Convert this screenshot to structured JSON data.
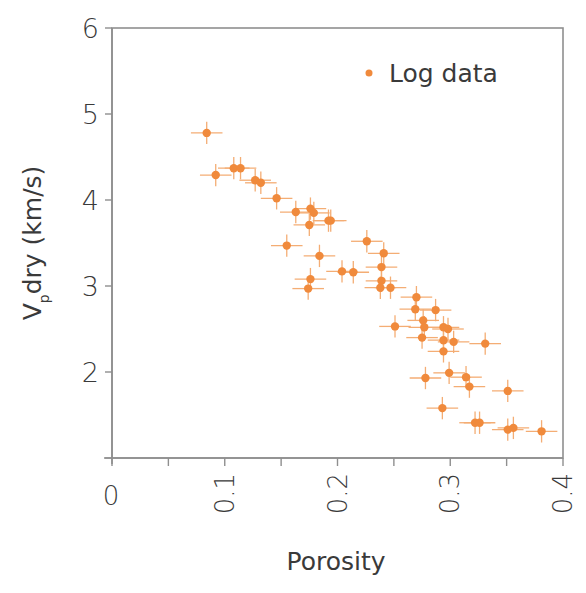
{
  "chart_data": {
    "type": "scatter",
    "title": "",
    "xlabel": "Porosity",
    "ylabel_main": "V",
    "ylabel_sub": "p",
    "ylabel_rest": "dry (km/s)",
    "ylabel": "Vp dry (km/s)",
    "xlim": [
      0,
      0.4
    ],
    "ylim": [
      1,
      6
    ],
    "x_ticks": [
      0,
      0.05,
      0.1,
      0.15,
      0.2,
      0.25,
      0.3,
      0.35,
      0.4
    ],
    "x_tick_labels": [
      {
        "value": 0,
        "label": "0"
      },
      {
        "value": 0.1,
        "label": "0.1"
      },
      {
        "value": 0.2,
        "label": "0.2"
      },
      {
        "value": 0.3,
        "label": "0.3"
      },
      {
        "value": 0.4,
        "label": "0.4"
      }
    ],
    "y_ticks": [
      1,
      2,
      3,
      4,
      5,
      6
    ],
    "y_tick_labels": [
      {
        "value": 2,
        "label": "2"
      },
      {
        "value": 3,
        "label": "3"
      },
      {
        "value": 4,
        "label": "4"
      },
      {
        "value": 5,
        "label": "5"
      },
      {
        "value": 6,
        "label": "6"
      }
    ],
    "grid": false,
    "legend": {
      "position": "upper right",
      "entries": [
        "Log data"
      ]
    },
    "colors": {
      "point": "#f08a3c",
      "errorbar": "#f4ad74",
      "axis": "#8f8f8f",
      "text": "#3a3a3a"
    },
    "error": {
      "x": 0.014,
      "y": 0.13
    },
    "series": [
      {
        "name": "Log data",
        "points": [
          [
            0.084,
            4.78
          ],
          [
            0.092,
            4.29
          ],
          [
            0.108,
            4.37
          ],
          [
            0.114,
            4.37
          ],
          [
            0.127,
            4.23
          ],
          [
            0.132,
            4.2
          ],
          [
            0.146,
            4.02
          ],
          [
            0.163,
            3.86
          ],
          [
            0.176,
            3.9
          ],
          [
            0.179,
            3.85
          ],
          [
            0.175,
            3.71
          ],
          [
            0.192,
            3.76
          ],
          [
            0.194,
            3.76
          ],
          [
            0.155,
            3.47
          ],
          [
            0.184,
            3.35
          ],
          [
            0.226,
            3.52
          ],
          [
            0.241,
            3.38
          ],
          [
            0.239,
            3.22
          ],
          [
            0.239,
            3.06
          ],
          [
            0.238,
            2.98
          ],
          [
            0.247,
            2.98
          ],
          [
            0.204,
            3.17
          ],
          [
            0.214,
            3.16
          ],
          [
            0.176,
            3.08
          ],
          [
            0.174,
            2.97
          ],
          [
            0.27,
            2.87
          ],
          [
            0.269,
            2.73
          ],
          [
            0.287,
            2.72
          ],
          [
            0.276,
            2.6
          ],
          [
            0.251,
            2.53
          ],
          [
            0.277,
            2.52
          ],
          [
            0.294,
            2.52
          ],
          [
            0.298,
            2.5
          ],
          [
            0.275,
            2.4
          ],
          [
            0.294,
            2.37
          ],
          [
            0.303,
            2.35
          ],
          [
            0.331,
            2.33
          ],
          [
            0.294,
            2.24
          ],
          [
            0.278,
            1.93
          ],
          [
            0.299,
            1.99
          ],
          [
            0.314,
            1.94
          ],
          [
            0.317,
            1.83
          ],
          [
            0.351,
            1.78
          ],
          [
            0.293,
            1.58
          ],
          [
            0.322,
            1.41
          ],
          [
            0.326,
            1.41
          ],
          [
            0.351,
            1.33
          ],
          [
            0.356,
            1.35
          ],
          [
            0.381,
            1.31
          ]
        ]
      }
    ]
  }
}
